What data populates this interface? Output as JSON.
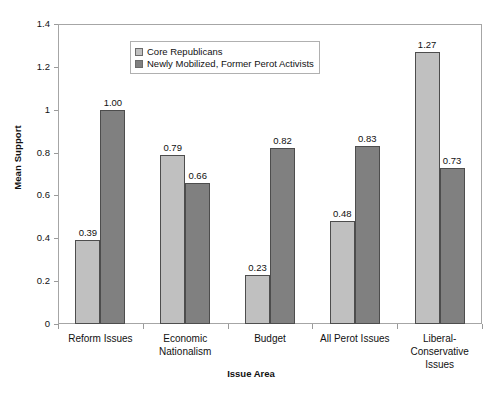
{
  "chart_data": {
    "type": "bar",
    "title": "",
    "xlabel": "Issue Area",
    "ylabel": "Mean Support",
    "ylim": [
      0,
      1.4
    ],
    "yticks": [
      "0",
      "0.2",
      "0.4",
      "0.6",
      "0.8",
      "1",
      "1.2",
      "1.4"
    ],
    "ytick_values": [
      0,
      0.2,
      0.4,
      0.6,
      0.8,
      1,
      1.2,
      1.4
    ],
    "grid": false,
    "legend_position": "top-left-inside",
    "categories": [
      "Reform Issues",
      "Economic Nationalism",
      "Budget",
      "All Perot Issues",
      "Liberal-Conservative Issues"
    ],
    "category_lines": [
      [
        "Reform Issues"
      ],
      [
        "Economic",
        "Nationalism"
      ],
      [
        "Budget"
      ],
      [
        "All Perot Issues"
      ],
      [
        "Liberal-",
        "Conservative",
        "Issues"
      ]
    ],
    "series": [
      {
        "name": "Core Republicans",
        "color": "#c0c0c0",
        "values": [
          0.39,
          0.79,
          0.23,
          0.48,
          1.27
        ],
        "labels": [
          "0.39",
          "0.79",
          "0.23",
          "0.48",
          "1.27"
        ]
      },
      {
        "name": "Newly Mobilized, Former Perot Activists",
        "color": "#808080",
        "values": [
          1.0,
          0.66,
          0.82,
          0.83,
          0.73
        ],
        "labels": [
          "1.00",
          "0.66",
          "0.82",
          "0.83",
          "0.73"
        ]
      }
    ]
  }
}
